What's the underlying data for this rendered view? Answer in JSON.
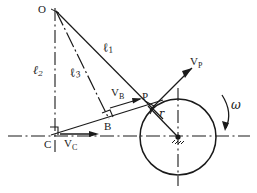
{
  "figure": {
    "stroke_color": "#1a1a1a",
    "background_color": "#ffffff"
  },
  "points": {
    "O": {
      "label": "O",
      "x": 55,
      "y": 10,
      "label_x": 38,
      "label_y": 5
    },
    "C": {
      "label": "C",
      "x": 50,
      "y": 136,
      "label_x": 44,
      "label_y": 140
    },
    "B": {
      "label": "B",
      "x": 108,
      "y": 118,
      "label_x": 104,
      "label_y": 122
    },
    "P": {
      "label": "P",
      "x": 147,
      "y": 106,
      "label_x": 143,
      "label_y": 93
    },
    "center": {
      "label": "",
      "x": 178,
      "y": 137
    }
  },
  "lengths": {
    "l1": {
      "symbol": "ℓ",
      "sub": "1",
      "label_x": 105,
      "label_y": 47
    },
    "l2": {
      "symbol": "ℓ",
      "sub": "2",
      "label_x": 36,
      "label_y": 70
    },
    "l3": {
      "symbol": "ℓ",
      "sub": "3",
      "label_x": 73,
      "label_y": 72
    },
    "r": {
      "symbol": "r",
      "label_x": 161,
      "label_y": 114
    }
  },
  "velocities": {
    "vp": {
      "symbol": "V",
      "sub": "P",
      "label_x": 192,
      "label_y": 62
    },
    "vb": {
      "symbol": "V",
      "sub": "B",
      "label_x": 113,
      "label_y": 93
    },
    "vc": {
      "symbol": "V",
      "sub": "C",
      "label_x": 66,
      "label_y": 141
    }
  },
  "rotation": {
    "symbol": "ω",
    "label_x": 233,
    "label_y": 105,
    "direction": "clockwise"
  },
  "circle": {
    "cx": 178,
    "cy": 137,
    "r": 38
  },
  "markers": {
    "right_angle_at_C": true,
    "right_angle_at_B": true,
    "right_angle_at_P": true,
    "pivot_hatch_at_center": true
  }
}
